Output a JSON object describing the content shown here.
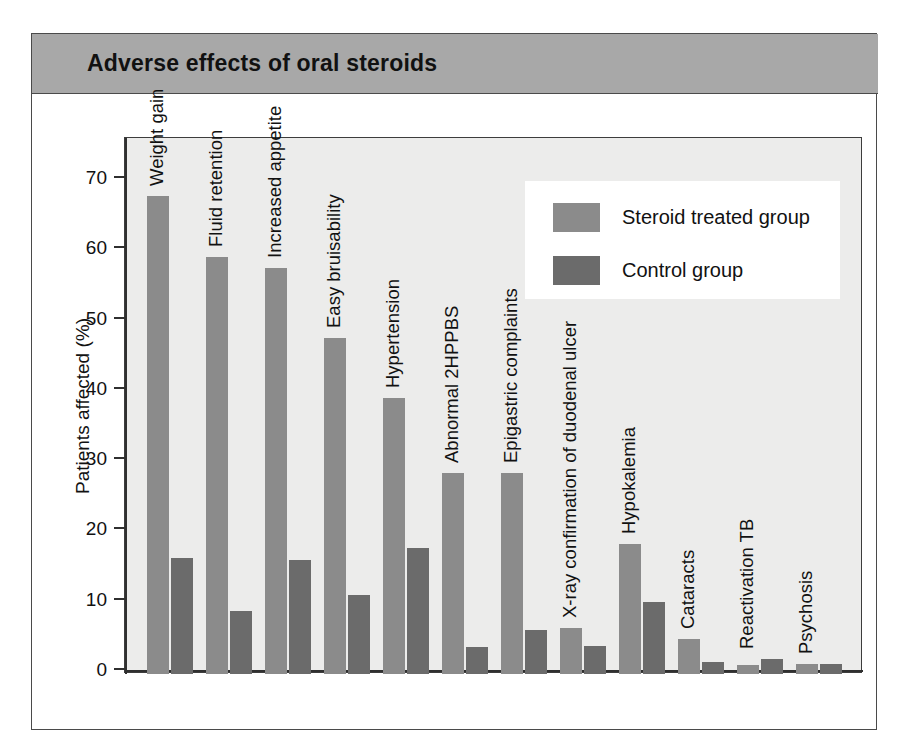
{
  "figure": {
    "title": "Adverse effects of oral steroids"
  },
  "legend": {
    "position": "top-right",
    "entries": [
      {
        "label": "Steroid treated group",
        "color": "#8b8b8b"
      },
      {
        "label": "Control group",
        "color": "#6b6b6b"
      }
    ]
  },
  "axis": {
    "y_title": "Patients affected (%)",
    "y_ticks": [
      "0",
      "10",
      "20",
      "30",
      "40",
      "50",
      "60",
      "70"
    ]
  },
  "chart_data": {
    "type": "bar",
    "title": "Adverse effects of oral steroids",
    "xlabel": "",
    "ylabel": "Patients affected (%)",
    "ylim": [
      0,
      76
    ],
    "grid": false,
    "legend_position": "top-right",
    "categories": [
      "Weight gain",
      "Fluid retention",
      "Increased appetite",
      "Easy bruisability",
      "Hypertension",
      "Abnormal 2HPPBS",
      "Epigastric complaints",
      "X-ray confirmation of duodenal ulcer",
      "Hypokalemia",
      "Cataracts",
      "Reactivation TB",
      "Psychosis"
    ],
    "series": [
      {
        "name": "Steroid treated group",
        "color": "#8b8b8b",
        "values": [
          67.7,
          59.0,
          57.5,
          47.5,
          39.0,
          28.3,
          28.3,
          6.3,
          18.2,
          4.7,
          1.0,
          1.1
        ]
      },
      {
        "name": "Control group",
        "color": "#6b6b6b",
        "values": [
          16.2,
          8.7,
          16.0,
          11.0,
          17.7,
          3.5,
          6.0,
          3.7,
          10.0,
          1.4,
          1.8,
          1.1
        ]
      }
    ]
  }
}
